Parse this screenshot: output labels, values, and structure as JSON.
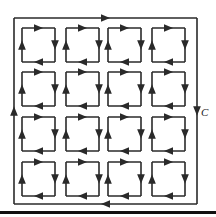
{
  "diagram": {
    "colors": {
      "line": "#2a2a2a",
      "background": "#ffffff",
      "rule": "#111111"
    },
    "outer_curve": {
      "label": "C",
      "orientation": "clockwise",
      "x": 14,
      "y": 18,
      "width": 183,
      "height": 186
    },
    "grid": {
      "rows": 4,
      "cols": 4,
      "orientation": "clockwise",
      "col_x": [
        22,
        66,
        108,
        152
      ],
      "row_y": [
        28,
        72,
        117,
        162
      ],
      "cell_w": 33,
      "cell_h": 34
    },
    "bottom_rule": {
      "y": 212
    }
  }
}
